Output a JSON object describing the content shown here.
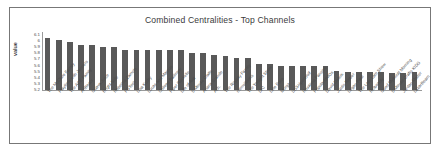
{
  "chart_data": {
    "type": "bar",
    "title": "Combined Centralities - Top Channels",
    "xlabel": "",
    "ylabel": "value",
    "ylim": [
      5.2,
      6.15
    ],
    "grid": false,
    "legend": null,
    "bar_color": "#595959",
    "yticks": [
      "6.1",
      "6",
      "5.9",
      "5.8",
      "5.7",
      "5.6",
      "5.5",
      "5.4",
      "5.3",
      "5.2"
    ],
    "categories": [
      "The McClure Family",
      "Playtime with Jenners",
      "The ACE Family",
      "ArtBeats",
      "Guava Juice",
      "Bright Side",
      "Rebecca Zamolo",
      "FGTeeV",
      "Lisa Kudry",
      "Lucas and Marcus",
      "Colleen Ballinger",
      "Piper Rockelle",
      "Life of Ava",
      "5 Minute Crafts",
      "Ariana Grande",
      "Ach.",
      "The Royalty Family",
      "merrelltwins",
      "The Tonight Show",
      "DIC",
      "Lele Pons",
      "Morgz",
      "SSSniperWolf",
      "Rosanna Pansino",
      "PopularMMOs",
      "David Dobrik",
      "Justin Bieber",
      "Logan Paul",
      "The Late Late Show",
      "Rclbeauty",
      "Good Mythical Morning",
      "5-Minute Crafts KIDS",
      "Jordan Matter",
      "LazarBeam"
    ],
    "values": [
      6.06,
      6.02,
      5.98,
      5.94,
      5.93,
      5.91,
      5.9,
      5.86,
      5.86,
      5.86,
      5.86,
      5.85,
      5.85,
      5.8,
      5.8,
      5.78,
      5.76,
      5.73,
      5.72,
      5.63,
      5.62,
      5.6,
      5.6,
      5.59,
      5.59,
      5.59,
      5.51,
      5.5,
      5.5,
      5.5,
      5.49,
      5.48,
      5.48,
      5.49
    ]
  }
}
